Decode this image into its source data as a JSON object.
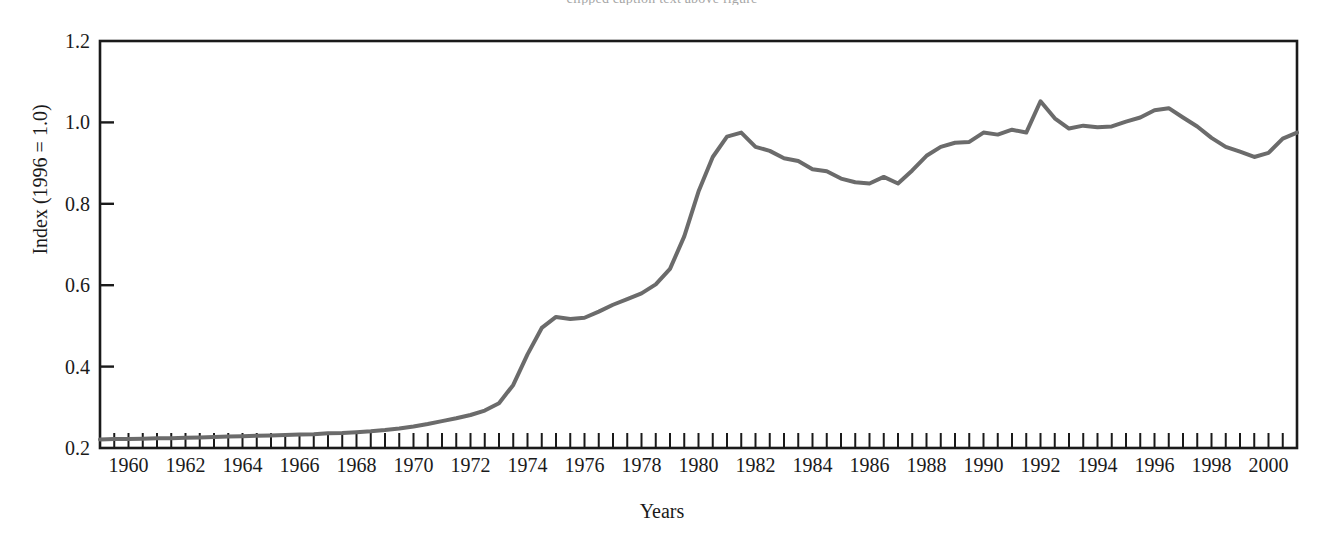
{
  "figure": {
    "caption_sliver": "clipped caption text above figure",
    "background_color": "#ffffff"
  },
  "chart_data": {
    "type": "line",
    "title": "",
    "xlabel": "Years",
    "ylabel": "Index (1996 = 1.0)",
    "xlim": [
      1959,
      2001
    ],
    "ylim": [
      0.2,
      1.2
    ],
    "grid": false,
    "legend": null,
    "line_color": "#6b6b6b",
    "line_width": 4,
    "axis_color": "#1a1a1a",
    "ytick_labels": [
      "0.2",
      "0.4",
      "0.6",
      "0.8",
      "1.0",
      "1.2"
    ],
    "ytick_values": [
      0.2,
      0.4,
      0.6,
      0.8,
      1.0,
      1.2
    ],
    "xtick_labels": [
      "1960",
      "1962",
      "1964",
      "1966",
      "1968",
      "1970",
      "1972",
      "1974",
      "1976",
      "1978",
      "1980",
      "1982",
      "1984",
      "1986",
      "1988",
      "1990",
      "1992",
      "1994",
      "1996",
      "1998",
      "2000"
    ],
    "xtick_values": [
      1960,
      1962,
      1964,
      1966,
      1968,
      1970,
      1972,
      1974,
      1976,
      1978,
      1980,
      1982,
      1984,
      1986,
      1988,
      1990,
      1992,
      1994,
      1996,
      1998,
      2000
    ],
    "minor_tick_interval": 0.5,
    "x": [
      1959.0,
      1959.5,
      1960.0,
      1960.5,
      1961.0,
      1961.5,
      1962.0,
      1962.5,
      1963.0,
      1963.5,
      1964.0,
      1964.5,
      1965.0,
      1965.5,
      1966.0,
      1966.5,
      1967.0,
      1967.5,
      1968.0,
      1968.5,
      1969.0,
      1969.5,
      1970.0,
      1970.5,
      1971.0,
      1971.5,
      1972.0,
      1972.5,
      1973.0,
      1973.5,
      1974.0,
      1974.5,
      1975.0,
      1975.5,
      1976.0,
      1976.5,
      1977.0,
      1977.5,
      1978.0,
      1978.5,
      1979.0,
      1979.5,
      1980.0,
      1980.5,
      1981.0,
      1981.5,
      1982.0,
      1982.5,
      1983.0,
      1983.5,
      1984.0,
      1984.5,
      1985.0,
      1985.5,
      1986.0,
      1986.5,
      1987.0,
      1987.5,
      1988.0,
      1988.5,
      1989.0,
      1989.5,
      1990.0,
      1990.5,
      1991.0,
      1991.5,
      1992.0,
      1992.5,
      1993.0,
      1993.5,
      1994.0,
      1994.5,
      1995.0,
      1995.5,
      1996.0,
      1996.5,
      1997.0,
      1997.5,
      1998.0,
      1998.5,
      1999.0,
      1999.5,
      2000.0,
      2000.5,
      2001.0
    ],
    "y": [
      0.221,
      0.222,
      0.222,
      0.223,
      0.224,
      0.224,
      0.225,
      0.226,
      0.227,
      0.228,
      0.229,
      0.23,
      0.231,
      0.232,
      0.233,
      0.234,
      0.236,
      0.237,
      0.239,
      0.241,
      0.244,
      0.248,
      0.253,
      0.259,
      0.266,
      0.273,
      0.281,
      0.292,
      0.31,
      0.355,
      0.43,
      0.495,
      0.522,
      0.517,
      0.52,
      0.535,
      0.552,
      0.566,
      0.58,
      0.602,
      0.64,
      0.72,
      0.83,
      0.915,
      0.965,
      0.975,
      0.94,
      0.93,
      0.912,
      0.905,
      0.885,
      0.88,
      0.862,
      0.853,
      0.85,
      0.866,
      0.85,
      0.882,
      0.918,
      0.94,
      0.95,
      0.952,
      0.975,
      0.97,
      0.982,
      0.975,
      1.052,
      1.01,
      0.985,
      0.992,
      0.988,
      0.99,
      1.002,
      1.012,
      1.03,
      1.035,
      1.012,
      0.99,
      0.962,
      0.94,
      0.928,
      0.915,
      0.925,
      0.96,
      0.975
    ]
  }
}
